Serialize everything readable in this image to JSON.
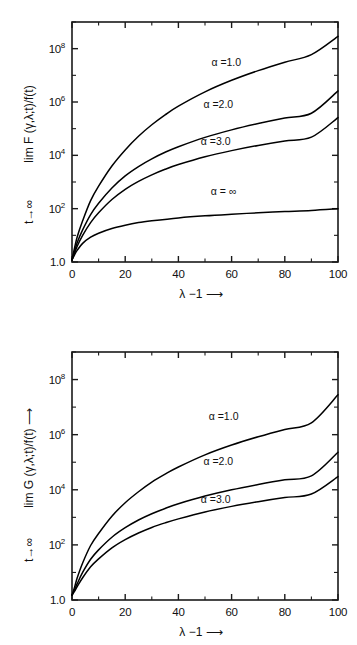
{
  "document": {
    "kind": "two-panel-scientific-figure",
    "background": "#ffffff",
    "ink": "#111111"
  },
  "chart_data": [
    {
      "id": "panel-top",
      "type": "line",
      "title": "",
      "xlabel": "λ −1 ⟶",
      "ylabel": "lim F (γ,λ;t)/f(t)",
      "ylabel_sub": "t→∞",
      "ylabel_arrow": "",
      "xlim": [
        0,
        100
      ],
      "ylim": [
        1,
        1000000000
      ],
      "yscale": "log",
      "xscale": "linear",
      "grid": false,
      "legend_position": "inline-curve-labels",
      "xticks": [
        0,
        20,
        40,
        60,
        80,
        100
      ],
      "xticklabels": [
        "0",
        "20",
        "40",
        "60",
        "80",
        "100"
      ],
      "yticks": [
        1,
        100,
        10000,
        1000000,
        100000000
      ],
      "yticklabels": [
        "1.0",
        "10",
        "10",
        "10",
        "10"
      ],
      "ytickexponents": [
        "",
        "2",
        "4",
        "6",
        "8"
      ],
      "yminorticks": [
        10,
        1000,
        100000,
        10000000,
        1000000000
      ],
      "series": [
        {
          "name": "α =1.0",
          "label": "α =1.0",
          "label_x": 58,
          "label_y": 22000000,
          "x": [
            0,
            1,
            2,
            4,
            7,
            10,
            15,
            20,
            25,
            30,
            35,
            40,
            50,
            60,
            70,
            80,
            90,
            100
          ],
          "y": [
            1.2,
            3.5,
            9,
            35,
            200,
            700,
            4000,
            16000,
            52000,
            140000,
            330000,
            700000,
            2400000,
            6500000,
            15000000,
            31000000,
            60000000,
            290000000
          ]
        },
        {
          "name": "α =2.0",
          "label": "α =2.0",
          "label_x": 55,
          "label_y": 600000,
          "x": [
            0,
            1,
            2,
            4,
            7,
            10,
            15,
            20,
            25,
            30,
            35,
            40,
            50,
            60,
            70,
            80,
            90,
            100
          ],
          "y": [
            1.2,
            2.6,
            5.5,
            16,
            60,
            160,
            600,
            1700,
            3800,
            7400,
            13000,
            21000,
            47000,
            90000,
            155000,
            250000,
            380000,
            2600000
          ]
        },
        {
          "name": "α =3.0",
          "label": "α =3.0",
          "label_x": 54,
          "label_y": 24000,
          "x": [
            0,
            1,
            2,
            4,
            7,
            10,
            15,
            20,
            25,
            30,
            35,
            40,
            50,
            60,
            70,
            80,
            90,
            100
          ],
          "y": [
            1.2,
            2.2,
            4.0,
            10,
            30,
            70,
            220,
            530,
            1050,
            1850,
            3000,
            4500,
            8800,
            15000,
            23500,
            34500,
            48000,
            260000
          ]
        },
        {
          "name": "α = ∞",
          "label": "α = ∞",
          "label_x": 57,
          "label_y": 330,
          "x": [
            0,
            1,
            2,
            4,
            7,
            10,
            15,
            20,
            25,
            30,
            40,
            50,
            60,
            70,
            80,
            90,
            100
          ],
          "y": [
            1.2,
            1.9,
            2.8,
            5.0,
            8.5,
            12,
            18,
            24,
            30,
            35,
            45,
            54,
            62,
            70,
            78,
            86,
            100
          ]
        }
      ]
    },
    {
      "id": "panel-bottom",
      "type": "line",
      "title": "",
      "xlabel": "λ −1 ⟶",
      "ylabel": "lim G (γ,λ;t)/f(t) ⟶",
      "ylabel_sub": "t→∞",
      "xlim": [
        0,
        100
      ],
      "ylim": [
        1,
        1000000000
      ],
      "yscale": "log",
      "xscale": "linear",
      "grid": false,
      "legend_position": "inline-curve-labels",
      "xticks": [
        0,
        20,
        40,
        60,
        80,
        100
      ],
      "xticklabels": [
        "0",
        "20",
        "40",
        "60",
        "80",
        "100"
      ],
      "yticks": [
        1,
        100,
        10000,
        1000000,
        100000000
      ],
      "yticklabels": [
        "1.0",
        "10",
        "10",
        "10",
        "10"
      ],
      "ytickexponents": [
        "",
        "2",
        "4",
        "6",
        "8"
      ],
      "yminorticks": [
        10,
        1000,
        100000,
        10000000,
        1000000000
      ],
      "series": [
        {
          "name": "α =1.0",
          "label": "α =1.0",
          "label_x": 57,
          "label_y": 3500000,
          "x": [
            0,
            1,
            2,
            4,
            7,
            10,
            15,
            20,
            25,
            30,
            35,
            40,
            50,
            60,
            70,
            80,
            90,
            100
          ],
          "y": [
            1.5,
            3.0,
            6.5,
            22,
            95,
            260,
            1100,
            3400,
            8500,
            19000,
            37000,
            67000,
            185000,
            420000,
            840000,
            1550000,
            2700000,
            28000000
          ]
        },
        {
          "name": "α =2.0",
          "label": "α =2.0",
          "label_x": 55,
          "label_y": 80000,
          "x": [
            0,
            1,
            2,
            4,
            7,
            10,
            15,
            20,
            25,
            30,
            35,
            40,
            50,
            60,
            70,
            80,
            90,
            100
          ],
          "y": [
            1.5,
            2.4,
            4.0,
            10,
            30,
            66,
            190,
            420,
            800,
            1350,
            2100,
            3100,
            5900,
            10000,
            15500,
            23000,
            32000,
            230000
          ]
        },
        {
          "name": "α =3.0",
          "label": "α =3.0",
          "label_x": 54,
          "label_y": 3400,
          "x": [
            0,
            1,
            2,
            4,
            7,
            10,
            15,
            20,
            25,
            30,
            35,
            40,
            50,
            60,
            70,
            80,
            90,
            100
          ],
          "y": [
            1.5,
            2.1,
            3.1,
            6.4,
            16,
            31,
            78,
            155,
            270,
            430,
            630,
            880,
            1570,
            2500,
            3700,
            5200,
            7000,
            30000
          ]
        }
      ]
    }
  ]
}
